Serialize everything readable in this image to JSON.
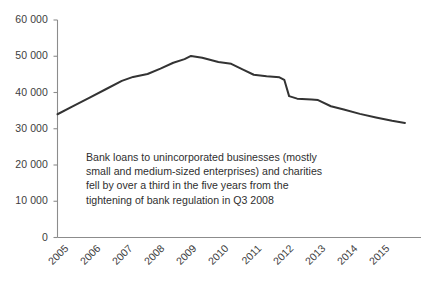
{
  "chart_data": {
    "type": "line",
    "title": "",
    "subtitle": "",
    "xlabel": "",
    "ylabel": "",
    "x": [
      2005,
      2006,
      2007,
      2008,
      2009,
      2010,
      2011,
      2012,
      2013,
      2014,
      2015
    ],
    "categories": [
      "2005",
      "2006",
      "2007",
      "2008",
      "2009",
      "2010",
      "2011",
      "2012",
      "2013",
      "2014",
      "2015"
    ],
    "values": [
      34000,
      38500,
      43000,
      45500,
      49800,
      48000,
      45500,
      43000,
      37800,
      35000,
      32000
    ],
    "series": [
      {
        "name": "Bank loans to unincorporated businesses and charities",
        "values": [
          34000,
          38500,
          43000,
          45500,
          49800,
          48000,
          45500,
          43000,
          37800,
          35000,
          32000
        ]
      }
    ],
    "detailed_points": [
      {
        "x": 2005.0,
        "y": 34000
      },
      {
        "x": 2005.5,
        "y": 36300
      },
      {
        "x": 2006.0,
        "y": 38600
      },
      {
        "x": 2006.5,
        "y": 40900
      },
      {
        "x": 2007.0,
        "y": 43200
      },
      {
        "x": 2007.35,
        "y": 44300
      },
      {
        "x": 2007.8,
        "y": 45100
      },
      {
        "x": 2008.2,
        "y": 46600
      },
      {
        "x": 2008.6,
        "y": 48200
      },
      {
        "x": 2008.95,
        "y": 49200
      },
      {
        "x": 2009.15,
        "y": 50100
      },
      {
        "x": 2009.5,
        "y": 49600
      },
      {
        "x": 2010.0,
        "y": 48400
      },
      {
        "x": 2010.4,
        "y": 47900
      },
      {
        "x": 2010.8,
        "y": 46200
      },
      {
        "x": 2011.1,
        "y": 44900
      },
      {
        "x": 2011.5,
        "y": 44500
      },
      {
        "x": 2011.9,
        "y": 44200
      },
      {
        "x": 2012.05,
        "y": 43500
      },
      {
        "x": 2012.2,
        "y": 39000
      },
      {
        "x": 2012.45,
        "y": 38300
      },
      {
        "x": 2012.9,
        "y": 38100
      },
      {
        "x": 2013.1,
        "y": 37900
      },
      {
        "x": 2013.5,
        "y": 36200
      },
      {
        "x": 2013.9,
        "y": 35300
      },
      {
        "x": 2014.4,
        "y": 34100
      },
      {
        "x": 2014.9,
        "y": 33100
      },
      {
        "x": 2015.4,
        "y": 32200
      },
      {
        "x": 2015.8,
        "y": 31600
      }
    ],
    "ylim": [
      0,
      60000
    ],
    "ytick_values": [
      0,
      10000,
      20000,
      30000,
      40000,
      50000,
      60000
    ],
    "ytick_labels": [
      "0",
      "10 000",
      "20 000",
      "30 000",
      "40 000",
      "50 000",
      "60 000"
    ],
    "xlim": [
      2005,
      2016.3
    ],
    "grid": false,
    "legend": null,
    "legend_position": "none",
    "line_color": "#333333",
    "background_color": "#ffffff",
    "axis_color": "#8c8c8c",
    "annotations": [
      {
        "text": "Bank loans to unincorporated businesses (mostly\nsmall and medium-sized enterprises) and charities\nfell by over a third in the five years from the\ntightening of bank regulation in Q3 2008",
        "x": 2007.0,
        "y": 19500
      }
    ]
  },
  "axes": {
    "y_ticks": [
      {
        "label": "60 000",
        "top": 14
      },
      {
        "label": "50 000",
        "top": 50
      },
      {
        "label": "40 000",
        "top": 86
      },
      {
        "label": "30 000",
        "top": 123
      },
      {
        "label": "20 000",
        "top": 159
      },
      {
        "label": "10 000",
        "top": 195
      },
      {
        "label": "0",
        "top": 231
      }
    ],
    "x_ticks": [
      {
        "label": "2005",
        "left": 61
      },
      {
        "label": "2006",
        "left": 93
      },
      {
        "label": "2007",
        "left": 126
      },
      {
        "label": "2008",
        "left": 158
      },
      {
        "label": "2009",
        "left": 191
      },
      {
        "label": "2010",
        "left": 223
      },
      {
        "label": "2011",
        "left": 256
      },
      {
        "label": "2012",
        "left": 288
      },
      {
        "label": "2013",
        "left": 321
      },
      {
        "label": "2014",
        "left": 353
      },
      {
        "label": "2015",
        "left": 386
      }
    ]
  },
  "annotation": {
    "line1": "Bank loans to unincorporated businesses (mostly",
    "line2": "small and medium-sized enterprises) and charities",
    "line3": "fell by over a third in the five years from the",
    "line4": "tightening of bank regulation in Q3 2008"
  }
}
